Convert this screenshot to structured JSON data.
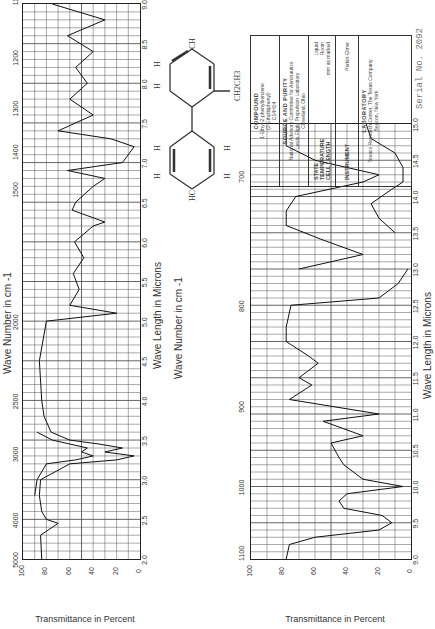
{
  "top_chart": {
    "xaxis_top_title": "Wave Number in cm -1",
    "xaxis_bottom_title": "Wave Length in Microns",
    "ylabel": "Transmittance in Percent",
    "wavenumber_ticks": [
      "5000",
      "4000",
      "3000",
      "2500",
      "2000",
      "1500",
      "1400",
      "1300",
      "1200",
      "1100"
    ],
    "micron_ticks": [
      "2.0",
      "2.5",
      "3.0",
      "3.5",
      "4.0",
      "4.5",
      "5.0",
      "5.5",
      "6.0",
      "6.5",
      "7.0",
      "7.5",
      "8.0",
      "8.5",
      "9.0"
    ],
    "y_ticks": [
      "100",
      "80",
      "60",
      "40",
      "20",
      "0"
    ],
    "annotations": [
      "0.025",
      "0.198",
      "0.024",
      "0.198",
      "0.024"
    ]
  },
  "bottom_chart": {
    "xaxis_top_title": "Wave Number in cm -1",
    "xaxis_bottom_title": "Wave Length in Microns",
    "ylabel": "Transmittance in Percent",
    "wavenumber_ticks": [
      "1100",
      "1000",
      "900",
      "800",
      "700"
    ],
    "micron_ticks": [
      "9.0",
      "9.5",
      "10.0",
      "10.5",
      "11.0",
      "11.5",
      "12.0",
      "12.5",
      "13.0",
      "13.5",
      "14.0",
      "14.5",
      "15.0"
    ],
    "y_ticks": [
      "100",
      "80",
      "60",
      "40",
      "20",
      "0"
    ],
    "annotations": [
      "0.198",
      "0.198",
      "CAP.L 169"
    ]
  },
  "molecule": {
    "labels": [
      "HC",
      "C",
      "H",
      "H",
      "C",
      "C",
      "H",
      "C",
      "C",
      "H",
      "C",
      "H",
      "C",
      "CH",
      "CH2CH3"
    ],
    "substituent": "CH2CH3"
  },
  "info_box": {
    "compound_header": "COMPOUND",
    "compound_name": "1-Ethyl-2-phenylbenzene",
    "compound_alt": "(2-Ethylbiphenyl)",
    "formula": "C14H14",
    "source_header": "SOURCE AND PURITY",
    "source_line1": "National Advisory Committee for Aeronautics",
    "source_line2": "Lewis Flight Propulsion Laboratory",
    "source_line3": "Cleveland, Ohio",
    "state_label": "STATE",
    "state_value": "Liquid",
    "temperature_label": "TEMPERATURE",
    "temperature_value": "Room",
    "cell_length_label": "CELL LENGTH",
    "cell_length_value": "mm as marked",
    "instrument_label": "INSTRUMENT",
    "instrument_value": "Perkin-Elmer",
    "laboratory_header": "LABORATORY",
    "laboratory_line1": "Texaco Research Center, The Texas Company",
    "laboratory_line2": "Beacon, New York"
  },
  "serial": "Serial No. 2092",
  "chart_data": [
    {
      "type": "line",
      "title": "IR spectrum 1-Ethyl-2-phenylbenzene (2.0–9.0 µm)",
      "xlabel": "Wave Length in Microns",
      "ylabel": "Transmittance in Percent",
      "x2label": "Wave Number in cm -1",
      "xlim": [
        2.0,
        9.0
      ],
      "ylim": [
        0,
        100
      ],
      "grid": true,
      "series": [
        {
          "name": "main trace",
          "x": [
            2.0,
            2.3,
            2.45,
            2.5,
            2.6,
            2.8,
            3.0,
            3.2,
            3.25,
            3.3,
            3.35,
            3.4,
            3.45,
            3.5,
            3.6,
            3.8,
            4.0,
            4.5,
            5.0,
            5.1,
            5.2,
            5.4,
            5.6,
            5.8,
            6.0,
            6.2,
            6.25,
            6.4,
            6.5,
            6.7,
            6.8,
            6.9,
            7.0,
            7.2,
            7.3,
            7.4,
            7.6,
            7.8,
            8.0,
            8.2,
            8.4,
            8.6,
            8.8,
            9.0
          ],
          "y": [
            84,
            85,
            70,
            80,
            84,
            86,
            85,
            60,
            20,
            5,
            30,
            15,
            35,
            60,
            76,
            82,
            84,
            86,
            80,
            20,
            60,
            52,
            57,
            48,
            56,
            40,
            30,
            58,
            55,
            40,
            30,
            62,
            15,
            5,
            25,
            70,
            40,
            60,
            45,
            55,
            40,
            62,
            30,
            75
          ]
        },
        {
          "name": "thin cell trace",
          "x": [
            2.8,
            3.0,
            3.2,
            3.25,
            3.3,
            3.35,
            3.4,
            3.5,
            3.6
          ],
          "y": [
            90,
            88,
            80,
            55,
            40,
            50,
            45,
            75,
            88
          ]
        }
      ]
    },
    {
      "type": "line",
      "title": "IR spectrum 1-Ethyl-2-phenylbenzene (9.0–15.0 µm)",
      "xlabel": "Wave Length in Microns",
      "ylabel": "Transmittance in Percent",
      "x2label": "Wave Number in cm -1",
      "xlim": [
        9.0,
        15.0
      ],
      "ylim": [
        0,
        100
      ],
      "grid": true,
      "series": [
        {
          "name": "main trace",
          "x": [
            9.0,
            9.2,
            9.3,
            9.4,
            9.5,
            9.6,
            9.7,
            9.8,
            9.9,
            10.0,
            10.1,
            10.3,
            10.4,
            10.6,
            10.7,
            10.9,
            11.0,
            11.2,
            11.4,
            11.5,
            11.7,
            11.8,
            12.0,
            12.2,
            12.5,
            12.6,
            12.8,
            13.0
          ],
          "y": [
            78,
            76,
            60,
            20,
            12,
            18,
            42,
            45,
            40,
            5,
            30,
            42,
            45,
            50,
            30,
            55,
            20,
            76,
            62,
            70,
            58,
            64,
            78,
            78,
            75,
            20,
            8,
            2
          ]
        },
        {
          "name": "second trace",
          "x": [
            13.0,
            13.2,
            13.4,
            13.6,
            13.8,
            14.0,
            14.2,
            14.3,
            14.5,
            14.7,
            15.0
          ],
          "y": [
            70,
            30,
            55,
            78,
            78,
            72,
            30,
            20,
            60,
            78,
            78
          ]
        },
        {
          "name": "lower trace",
          "x": [
            13.5,
            13.7,
            13.9,
            14.1,
            14.2,
            14.4,
            14.6,
            14.8,
            15.0
          ],
          "y": [
            10,
            20,
            25,
            12,
            5,
            5,
            10,
            25,
            28
          ]
        }
      ]
    }
  ]
}
